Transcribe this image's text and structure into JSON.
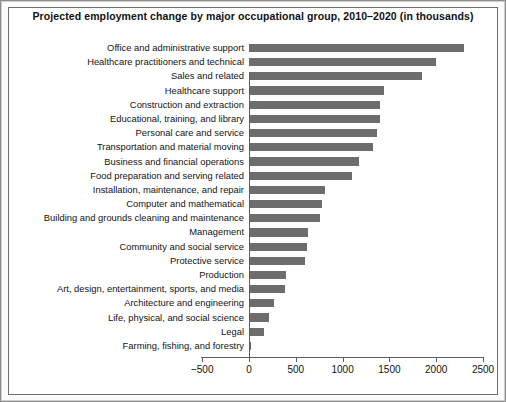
{
  "figure": {
    "title": "Projected employment change by major occupational group, 2010–2020 (in thousands)"
  },
  "chart_data": {
    "type": "bar",
    "orientation": "horizontal",
    "title": "Projected employment change by major occupational group, 2010–2020 (in thousands)",
    "xlabel": "",
    "ylabel": "",
    "xlim": [
      -500,
      2500
    ],
    "xticks": [
      -500,
      0,
      500,
      1000,
      1500,
      2000,
      2500
    ],
    "xtick_labels": [
      "−500",
      "0",
      "500",
      "1000",
      "1500",
      "2000",
      "2500"
    ],
    "grid": false,
    "legend": false,
    "bar_color": "#6d6d6d",
    "categories": [
      "Office and administrative support",
      "Healthcare practitioners and technical",
      "Sales and related",
      "Healthcare support",
      "Construction and extraction",
      "Educational, training, and library",
      "Personal care and service",
      "Transportation and material moving",
      "Business and financial operations",
      "Food preparation and serving related",
      "Installation, maintenance, and repair",
      "Computer and mathematical",
      "Building and grounds cleaning and maintenance",
      "Management",
      "Community and social service",
      "Protective service",
      "Production",
      "Art, design, entertainment, sports, and media",
      "Architecture and engineering",
      "Life, physical, and social science",
      "Legal",
      "Farming, fishing, and forestry"
    ],
    "values": [
      2300,
      2000,
      1850,
      1440,
      1400,
      1400,
      1370,
      1320,
      1180,
      1100,
      810,
      780,
      760,
      630,
      620,
      600,
      390,
      380,
      270,
      215,
      155,
      20
    ]
  }
}
